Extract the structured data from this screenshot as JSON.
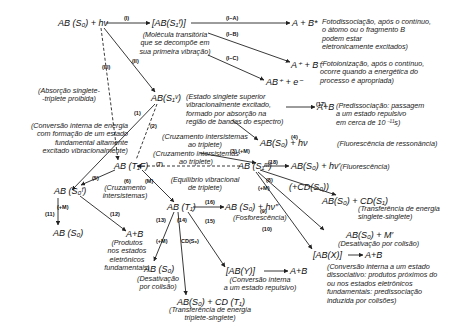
{
  "species": {
    "ground_hv": "AB (S₀) + hν",
    "transient": "[AB(S₁ᶠ)]",
    "dissoc_products": "A + B*",
    "ion_products": "A⁺ + B⁻",
    "ab_plus": "AB⁺ + e⁻",
    "s1_vib": "AB(S₁ᵛ)",
    "predissoc_products": "A+B",
    "fluor_resonance": "AB(S₀) + hν",
    "s1_m": "AB (S₁ᵐ)",
    "fluor": "AB(S₀) + hν′",
    "t1f": "AB (T₁F)",
    "s0f": "AB (S₀ᶠ)",
    "s0_final": "AB (S₀)",
    "frag_ground": "A+B",
    "t1": "AB (T₁)",
    "phos": "AB (S₀) + hν″",
    "plus_cd": "(+CD(S₀))",
    "ss_transfer": "AB(S₀) + CD(S₁)",
    "coll_deact": "AB(S₀) + M′",
    "abx": "[AB(X)]",
    "abx_products": "A+B",
    "aby": "[AB(Y)]",
    "aby_products": "A+B",
    "t1_coll": "AB (S₀)",
    "ts_transfer": "AB(S₀) + CD (T₁)"
  },
  "numbers": {
    "I": "(I)",
    "IA": "(I−A)",
    "IB": "(I−B)",
    "IC": "(I−C)",
    "II": "(II)",
    "III": "(III)",
    "n1": "(1)",
    "n2": "(2)",
    "n3": "(3) (+M)",
    "n4": "(4)",
    "n5": "(5)",
    "n6": "(6)",
    "nM": "(M)",
    "n7": "(7)",
    "n8": "(8)",
    "nplusM": "(+M)",
    "n9": "(9)",
    "n10": "(10)",
    "n11": "(11)",
    "n11M": "(+M)",
    "n12": "(12)",
    "n13": "(13)",
    "n13M": "(+M)",
    "n14": "(14)",
    "n14cd": "CD(S₀)",
    "n15": "(15)",
    "n16": "(16)",
    "n17": "(17)",
    "n18": "(18)"
  },
  "notes": {
    "transient": "(Molécula transitória\nque se decompõe em\nsua primeira vibração)",
    "photodissoc": "Fotodissociação, após o contínuo,\no átomo ou o fragmento B\npodem estar\neletronicamente excitados)",
    "photoion": "(Fotoionização, após o contínuo,\nocorre quando a energética do\nprocesso é apropriada)",
    "forbidden": "(Absorção singlete-\n-triplete proibida)",
    "s1_state": "(Estado singlete superior\nvibracionalmente excitado,\nformado por absorção na\nregião de bandas do espectro)",
    "predissoc": "(Predissociação: passagem\na um estado repulsivo\nem cerca de 10⁻¹¹s)",
    "internal_conv": "(Conversão interna de energia\ncom formação de um estado\nfundamental altamente\nexcitado vibracionalmente)",
    "isc1": "(Cruzamento intersistemas\nao triplete)",
    "isc2": "(Cruzamento intersistemas\nao triplete)",
    "fluor_res": "(Fluorescência de ressonância)",
    "fluor": "(Fluorescência)",
    "vib_eq": "(Equilíbrio vibracional\nde triplete)",
    "isc3": "(Cruzamento\nintersistemas)",
    "ground_products": "(Produtos\nnos estados\neletrônicos\nfundamentais)",
    "phos": "(Fosforescência)",
    "ss_transfer": "(Transferência de energia\nsinglete-singlete)",
    "coll_deact": "(Desativação por colisão)",
    "abx": "(Conversão interna a um estado\ndissociativo: produtos próximos do\nou nos estados eletrônicos\nfundamentais: predissociação\ninduzida por colisões)",
    "aby": "(Conversão interna\na um estado repulsivo)",
    "t1_coll": "(Desativação\npor colisão)",
    "ts_transfer": "(Transferência de energia\ntriplete-singlete)"
  }
}
